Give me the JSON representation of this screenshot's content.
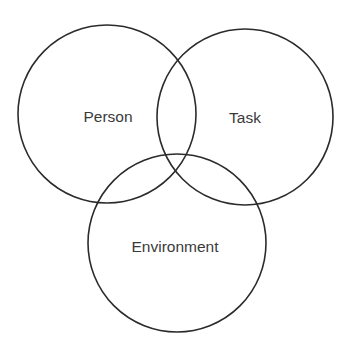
{
  "diagram": {
    "type": "venn",
    "sets": [
      {
        "id": "person",
        "label": "Person",
        "cx": 107,
        "cy": 114,
        "r": 89,
        "label_x": 108,
        "label_y": 122
      },
      {
        "id": "task",
        "label": "Task",
        "cx": 245,
        "cy": 117,
        "r": 88,
        "label_x": 245,
        "label_y": 123
      },
      {
        "id": "environment",
        "label": "Environment",
        "cx": 177,
        "cy": 243,
        "r": 89,
        "label_x": 175,
        "label_y": 252
      }
    ],
    "stroke_color": "#2b2b2b",
    "text_color": "#3a3a3a",
    "background": "#ffffff"
  }
}
